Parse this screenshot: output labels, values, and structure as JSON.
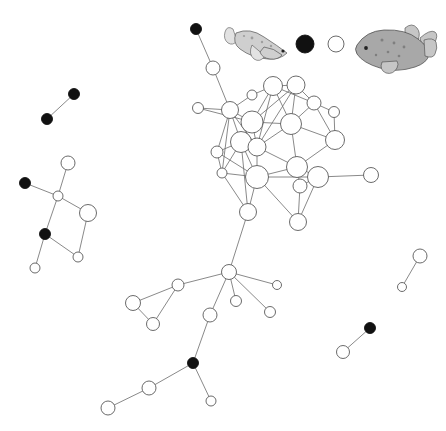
{
  "figure": {
    "kind": "social-network-graph",
    "background_color": "#ffffff",
    "width": 446,
    "height": 431,
    "node_open_fill": "#ffffff",
    "node_filled_fill": "#111111",
    "node_stroke": "#5a5a5a",
    "edge_color": "#6b6b6b"
  },
  "legend": {
    "items": [
      {
        "name": "legend-fish-slender",
        "type": "fish-illustration",
        "x": 258,
        "y": 40
      },
      {
        "name": "legend-node-filled",
        "type": "filled-circle",
        "x": 305,
        "y": 44,
        "r": 9
      },
      {
        "name": "legend-node-open",
        "type": "open-circle",
        "x": 336,
        "y": 44,
        "r": 8
      },
      {
        "name": "legend-fish-stocky",
        "type": "fish-illustration",
        "x": 395,
        "y": 42
      }
    ]
  },
  "chart_data": {
    "type": "scatter",
    "title": "",
    "xlabel": "",
    "ylabel": "",
    "nodes": [
      {
        "id": 1,
        "x": 196,
        "y": 29,
        "r": 5.5,
        "fill": "filled"
      },
      {
        "id": 2,
        "x": 213,
        "y": 68,
        "r": 7.0,
        "fill": "open"
      },
      {
        "id": 3,
        "x": 198,
        "y": 108,
        "r": 5.5,
        "fill": "open"
      },
      {
        "id": 4,
        "x": 230,
        "y": 110,
        "r": 8.5,
        "fill": "open"
      },
      {
        "id": 5,
        "x": 252,
        "y": 95,
        "r": 5.0,
        "fill": "open"
      },
      {
        "id": 6,
        "x": 252,
        "y": 122,
        "r": 11.0,
        "fill": "open"
      },
      {
        "id": 7,
        "x": 273,
        "y": 86,
        "r": 9.5,
        "fill": "open"
      },
      {
        "id": 8,
        "x": 296,
        "y": 85,
        "r": 9.0,
        "fill": "open"
      },
      {
        "id": 9,
        "x": 314,
        "y": 103,
        "r": 7.0,
        "fill": "open"
      },
      {
        "id": 10,
        "x": 334,
        "y": 112,
        "r": 5.5,
        "fill": "open"
      },
      {
        "id": 11,
        "x": 335,
        "y": 140,
        "r": 9.5,
        "fill": "open"
      },
      {
        "id": 12,
        "x": 291,
        "y": 124,
        "r": 10.5,
        "fill": "open"
      },
      {
        "id": 13,
        "x": 217,
        "y": 152,
        "r": 6.0,
        "fill": "open"
      },
      {
        "id": 14,
        "x": 222,
        "y": 173,
        "r": 5.0,
        "fill": "open"
      },
      {
        "id": 15,
        "x": 241,
        "y": 142,
        "r": 10.5,
        "fill": "open"
      },
      {
        "id": 16,
        "x": 257,
        "y": 147,
        "r": 9.0,
        "fill": "open"
      },
      {
        "id": 17,
        "x": 297,
        "y": 167,
        "r": 10.5,
        "fill": "open"
      },
      {
        "id": 18,
        "x": 257,
        "y": 177,
        "r": 11.5,
        "fill": "open"
      },
      {
        "id": 19,
        "x": 318,
        "y": 177,
        "r": 10.5,
        "fill": "open"
      },
      {
        "id": 20,
        "x": 371,
        "y": 175,
        "r": 7.5,
        "fill": "open"
      },
      {
        "id": 21,
        "x": 300,
        "y": 186,
        "r": 7.0,
        "fill": "open"
      },
      {
        "id": 22,
        "x": 248,
        "y": 212,
        "r": 8.5,
        "fill": "open"
      },
      {
        "id": 23,
        "x": 298,
        "y": 222,
        "r": 8.5,
        "fill": "open"
      },
      {
        "id": 24,
        "x": 229,
        "y": 272,
        "r": 7.5,
        "fill": "open"
      },
      {
        "id": 25,
        "x": 178,
        "y": 285,
        "r": 6.0,
        "fill": "open"
      },
      {
        "id": 26,
        "x": 133,
        "y": 303,
        "r": 7.5,
        "fill": "open"
      },
      {
        "id": 27,
        "x": 153,
        "y": 324,
        "r": 6.5,
        "fill": "open"
      },
      {
        "id": 28,
        "x": 236,
        "y": 301,
        "r": 5.5,
        "fill": "open"
      },
      {
        "id": 29,
        "x": 270,
        "y": 312,
        "r": 5.5,
        "fill": "open"
      },
      {
        "id": 30,
        "x": 277,
        "y": 285,
        "r": 4.5,
        "fill": "open"
      },
      {
        "id": 31,
        "x": 210,
        "y": 315,
        "r": 7.0,
        "fill": "open"
      },
      {
        "id": 32,
        "x": 193,
        "y": 363,
        "r": 5.5,
        "fill": "filled"
      },
      {
        "id": 33,
        "x": 149,
        "y": 388,
        "r": 7.0,
        "fill": "open"
      },
      {
        "id": 34,
        "x": 108,
        "y": 408,
        "r": 7.0,
        "fill": "open"
      },
      {
        "id": 35,
        "x": 211,
        "y": 401,
        "r": 5.0,
        "fill": "open"
      },
      {
        "id": 36,
        "x": 74,
        "y": 94,
        "r": 5.5,
        "fill": "filled"
      },
      {
        "id": 37,
        "x": 47,
        "y": 119,
        "r": 5.5,
        "fill": "filled"
      },
      {
        "id": 38,
        "x": 68,
        "y": 163,
        "r": 7.0,
        "fill": "open"
      },
      {
        "id": 39,
        "x": 25,
        "y": 183,
        "r": 5.5,
        "fill": "filled"
      },
      {
        "id": 40,
        "x": 58,
        "y": 196,
        "r": 5.0,
        "fill": "open"
      },
      {
        "id": 41,
        "x": 88,
        "y": 213,
        "r": 8.5,
        "fill": "open"
      },
      {
        "id": 42,
        "x": 45,
        "y": 234,
        "r": 5.5,
        "fill": "filled"
      },
      {
        "id": 43,
        "x": 78,
        "y": 257,
        "r": 5.0,
        "fill": "open"
      },
      {
        "id": 44,
        "x": 35,
        "y": 268,
        "r": 5.0,
        "fill": "open"
      },
      {
        "id": 45,
        "x": 420,
        "y": 256,
        "r": 7.0,
        "fill": "open"
      },
      {
        "id": 46,
        "x": 402,
        "y": 287,
        "r": 4.5,
        "fill": "open"
      },
      {
        "id": 47,
        "x": 370,
        "y": 328,
        "r": 5.5,
        "fill": "filled"
      },
      {
        "id": 48,
        "x": 343,
        "y": 352,
        "r": 6.5,
        "fill": "open"
      }
    ],
    "edges": [
      [
        1,
        2
      ],
      [
        2,
        4
      ],
      [
        3,
        4
      ],
      [
        3,
        6
      ],
      [
        4,
        5
      ],
      [
        4,
        6
      ],
      [
        4,
        13
      ],
      [
        4,
        15
      ],
      [
        4,
        16
      ],
      [
        4,
        14
      ],
      [
        5,
        7
      ],
      [
        6,
        7
      ],
      [
        6,
        8
      ],
      [
        6,
        12
      ],
      [
        6,
        16
      ],
      [
        6,
        15
      ],
      [
        7,
        8
      ],
      [
        7,
        12
      ],
      [
        7,
        16
      ],
      [
        7,
        9
      ],
      [
        8,
        9
      ],
      [
        8,
        12
      ],
      [
        8,
        16
      ],
      [
        9,
        10
      ],
      [
        9,
        11
      ],
      [
        9,
        12
      ],
      [
        10,
        11
      ],
      [
        11,
        12
      ],
      [
        11,
        17
      ],
      [
        12,
        16
      ],
      [
        12,
        17
      ],
      [
        13,
        14
      ],
      [
        13,
        15
      ],
      [
        13,
        18
      ],
      [
        14,
        15
      ],
      [
        14,
        18
      ],
      [
        14,
        22
      ],
      [
        15,
        16
      ],
      [
        15,
        18
      ],
      [
        15,
        22
      ],
      [
        16,
        17
      ],
      [
        16,
        18
      ],
      [
        17,
        18
      ],
      [
        17,
        19
      ],
      [
        17,
        21
      ],
      [
        18,
        19
      ],
      [
        18,
        22
      ],
      [
        18,
        23
      ],
      [
        19,
        20
      ],
      [
        19,
        21
      ],
      [
        19,
        23
      ],
      [
        21,
        23
      ],
      [
        22,
        24
      ],
      [
        24,
        25
      ],
      [
        24,
        28
      ],
      [
        24,
        29
      ],
      [
        24,
        30
      ],
      [
        24,
        31
      ],
      [
        25,
        26
      ],
      [
        25,
        27
      ],
      [
        26,
        27
      ],
      [
        31,
        32
      ],
      [
        32,
        33
      ],
      [
        32,
        35
      ],
      [
        33,
        34
      ],
      [
        36,
        37
      ],
      [
        38,
        40
      ],
      [
        39,
        40
      ],
      [
        40,
        41
      ],
      [
        40,
        42
      ],
      [
        41,
        43
      ],
      [
        42,
        43
      ],
      [
        42,
        44
      ],
      [
        45,
        46
      ],
      [
        47,
        48
      ]
    ]
  }
}
